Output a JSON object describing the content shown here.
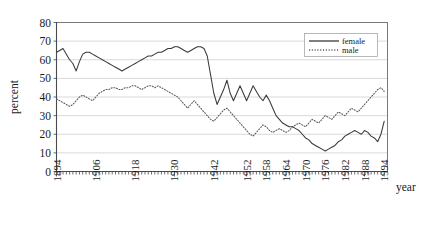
{
  "chart_data": {
    "type": "line",
    "title": "",
    "xlabel": "year",
    "ylabel": "percent",
    "ylim": [
      0,
      80
    ],
    "xlim": [
      1894,
      1995
    ],
    "ytick_labels": [
      "80",
      "70",
      "60",
      "50",
      "40",
      "30",
      "20",
      "10",
      "0"
    ],
    "ytick_values": [
      80,
      70,
      60,
      50,
      40,
      30,
      20,
      10,
      0
    ],
    "xtick_labels": [
      "1894",
      "1906",
      "1918",
      "1930",
      "1942",
      "1952",
      "1958",
      "1964",
      "1970",
      "1976",
      "1982",
      "1988",
      "1994"
    ],
    "xtick_values": [
      1894,
      1906,
      1918,
      1930,
      1942,
      1952,
      1958,
      1964,
      1970,
      1976,
      1982,
      1988,
      1994
    ],
    "grid": "horizontal",
    "legend_position": "top-right",
    "legend": [
      "female",
      "male"
    ],
    "x": [
      1894,
      1895,
      1896,
      1897,
      1898,
      1899,
      1900,
      1901,
      1902,
      1903,
      1904,
      1905,
      1906,
      1907,
      1908,
      1909,
      1910,
      1911,
      1912,
      1913,
      1914,
      1915,
      1916,
      1917,
      1918,
      1919,
      1920,
      1921,
      1922,
      1923,
      1924,
      1925,
      1926,
      1927,
      1928,
      1929,
      1930,
      1931,
      1932,
      1933,
      1934,
      1935,
      1936,
      1937,
      1938,
      1939,
      1940,
      1941,
      1942,
      1943,
      1944,
      1945,
      1946,
      1947,
      1948,
      1949,
      1950,
      1951,
      1952,
      1953,
      1954,
      1955,
      1956,
      1957,
      1958,
      1959,
      1960,
      1961,
      1962,
      1963,
      1964,
      1965,
      1966,
      1967,
      1968,
      1969,
      1970,
      1971,
      1972,
      1973,
      1974,
      1975,
      1976,
      1977,
      1978,
      1979,
      1980,
      1981,
      1982,
      1983,
      1984,
      1985,
      1986,
      1987,
      1988,
      1989,
      1990,
      1991,
      1992,
      1993,
      1994
    ],
    "series": [
      {
        "name": "female",
        "style": "solid",
        "color": "#3a3a3a",
        "values": [
          64,
          65,
          66,
          63,
          60,
          58,
          54,
          59,
          63,
          64,
          64,
          63,
          62,
          61,
          60,
          59,
          58,
          57,
          56,
          55,
          54,
          55,
          56,
          57,
          58,
          59,
          60,
          61,
          62,
          62,
          63,
          64,
          64,
          65,
          66,
          66,
          67,
          67,
          66,
          65,
          64,
          65,
          66,
          67,
          67,
          66,
          62,
          52,
          42,
          36,
          40,
          44,
          49,
          42,
          38,
          42,
          46,
          42,
          38,
          42,
          46,
          43,
          40,
          38,
          41,
          38,
          34,
          30,
          28,
          26,
          25,
          24,
          24,
          23,
          22,
          20,
          18,
          17,
          15,
          14,
          13,
          12,
          11,
          12,
          13,
          14,
          16,
          17,
          19,
          20,
          21,
          22,
          21,
          20,
          22,
          21,
          19,
          18,
          16,
          20,
          27
        ]
      },
      {
        "name": "male",
        "style": "dotted",
        "color": "#5a5a5a",
        "values": [
          39,
          38,
          37,
          36,
          35,
          36,
          38,
          40,
          41,
          40,
          39,
          38,
          40,
          42,
          43,
          44,
          44,
          45,
          45,
          44,
          44,
          45,
          45,
          46,
          46,
          45,
          44,
          45,
          46,
          46,
          45,
          46,
          45,
          44,
          43,
          42,
          41,
          40,
          38,
          36,
          34,
          36,
          38,
          36,
          34,
          32,
          30,
          28,
          27,
          29,
          31,
          33,
          34,
          32,
          30,
          28,
          26,
          24,
          22,
          20,
          19,
          21,
          23,
          25,
          24,
          22,
          21,
          22,
          23,
          22,
          21,
          22,
          24,
          25,
          26,
          25,
          24,
          26,
          28,
          27,
          26,
          28,
          30,
          29,
          28,
          30,
          32,
          31,
          30,
          32,
          34,
          33,
          32,
          34,
          36,
          38,
          40,
          42,
          44,
          45,
          43
        ]
      }
    ]
  },
  "axis": {
    "ylabel": "percent",
    "xlabel": "year"
  }
}
